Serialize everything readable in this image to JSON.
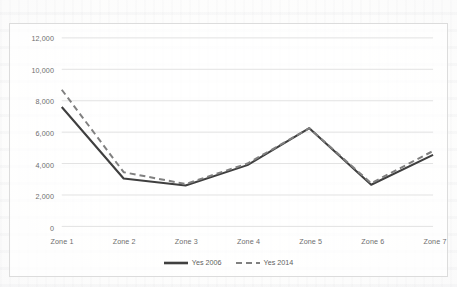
{
  "chart_data": {
    "type": "line",
    "title": "",
    "subtitle": "",
    "xlabel": "",
    "ylabel": "",
    "categories": [
      "Zone 1",
      "Zone 2",
      "Zone 3",
      "Zone 4",
      "Zone 5",
      "Zone 6",
      "Zone 7"
    ],
    "series": [
      {
        "name": "Yes 2006",
        "style": "solid",
        "color": "#3f3f3f",
        "values": [
          7600,
          3050,
          2600,
          3900,
          6250,
          2650,
          4550
        ]
      },
      {
        "name": "Yes 2014",
        "style": "dashed",
        "color": "#808080",
        "values": [
          8700,
          3450,
          2700,
          4000,
          6250,
          2750,
          4800
        ]
      }
    ],
    "ylim": [
      0,
      12000
    ],
    "ytick_values": [
      0,
      2000,
      4000,
      6000,
      8000,
      10000,
      12000
    ],
    "ytick_labels": [
      "0",
      "2,000",
      "4,000",
      "6,000",
      "8,000",
      "10,000",
      "12,000"
    ],
    "grid": true,
    "grid_axis": "y",
    "legend_position": "bottom",
    "markers": false
  },
  "axis": {
    "y_tick_labels": [
      "12,000",
      "10,000",
      "8,000",
      "6,000",
      "4,000",
      "2,000",
      "0"
    ],
    "x_tick_labels": [
      "Zone 1",
      "Zone 2",
      "Zone 3",
      "Zone 4",
      "Zone 5",
      "Zone 6",
      "Zone 7"
    ]
  },
  "legend": {
    "items": [
      {
        "label": "Yes 2006",
        "style": "solid"
      },
      {
        "label": "Yes 2014",
        "style": "dashed"
      }
    ]
  },
  "colors": {
    "series_2006": "#3f3f3f",
    "series_2014": "#808080",
    "gridline": "#e2e2e2",
    "frame": "#dcdcdc",
    "tick_text": "#6e6e6e",
    "page_background": "#fdfdfc"
  }
}
